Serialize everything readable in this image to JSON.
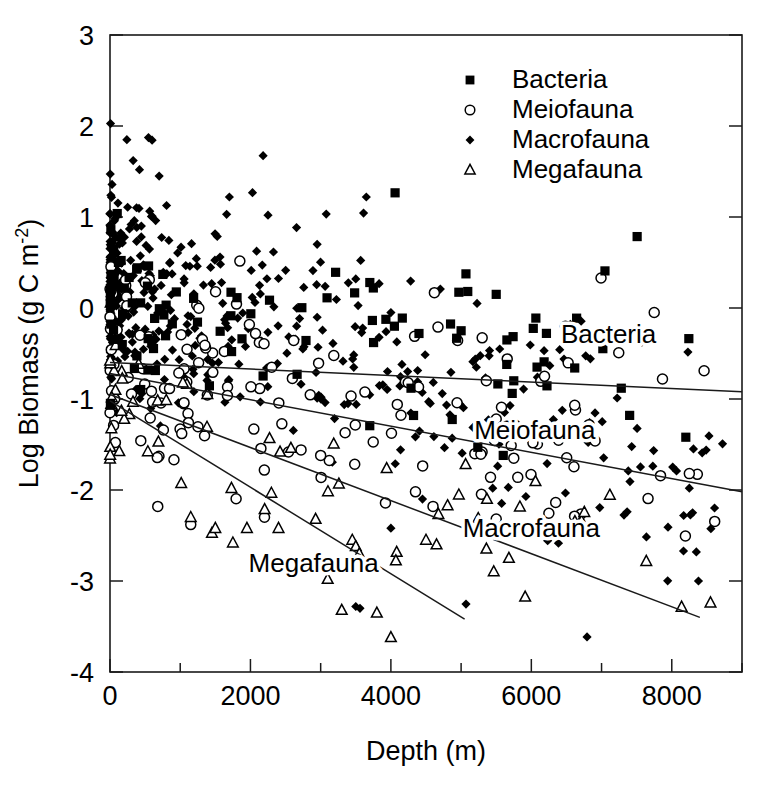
{
  "chart_data": {
    "type": "scatter",
    "title": "",
    "xlabel": "Depth (m)",
    "ylabel": "Log Biomass (g C m-2)",
    "ylabel_base": "Log Biomass (g C m",
    "ylabel_sup": "-2",
    "ylabel_close": ")",
    "xlim": [
      0,
      9000
    ],
    "ylim": [
      -4,
      3
    ],
    "xticks": [
      0,
      2000,
      4000,
      6000,
      8000
    ],
    "xtick_labels": [
      "0",
      "2000",
      "4000",
      "6000",
      "8000"
    ],
    "xminor_step": 1000,
    "yticks": [
      -4,
      -3,
      -2,
      -1,
      0,
      1,
      2,
      3
    ],
    "ytick_labels": [
      "-4",
      "-3",
      "-2",
      "-1",
      "0",
      "1",
      "2",
      "3"
    ],
    "grid": false,
    "legend_position": "top-right",
    "series": [
      {
        "name": "Bacteria",
        "marker": "filled-square",
        "color": "#000000",
        "n_points": 96,
        "inplot_label": "Bacteria",
        "fit": {
          "x0": 0,
          "y0": -0.6,
          "x1": 9000,
          "y1": -0.92
        },
        "label_xy": [
          7100,
          -0.38
        ],
        "cloud": {
          "y_at_x0": -0.2,
          "slope_per_m": -4e-05,
          "spread": 0.52,
          "depth_bias": 0.55
        },
        "outliers": [
          [
            3700,
            0.28
          ],
          [
            3750,
            0.22
          ],
          [
            4050,
            -0.2
          ],
          [
            4400,
            -0.28
          ],
          [
            5000,
            -0.25
          ],
          [
            5500,
            0.15
          ],
          [
            5650,
            -0.62
          ],
          [
            5750,
            -0.8
          ],
          [
            7400,
            -1.18
          ],
          [
            8200,
            -1.42
          ],
          [
            5600,
            -1.62
          ]
        ]
      },
      {
        "name": "Meiofauna",
        "marker": "open-circle",
        "color": "#000000",
        "n_points": 150,
        "inplot_label": "Meiofauna",
        "fit": {
          "x0": 0,
          "y0": -0.72,
          "x1": 9000,
          "y1": -2.02
        },
        "label_xy": [
          6050,
          -1.44
        ],
        "cloud": {
          "y_at_x0": -0.55,
          "slope_per_m": -0.00014,
          "spread": 0.55,
          "depth_bias": 0.5
        },
        "outliers": [
          [
            5500,
            -1.22
          ],
          [
            5650,
            -1.3
          ],
          [
            4350,
            -2.02
          ],
          [
            4600,
            -2.18
          ],
          [
            5500,
            -2.32
          ],
          [
            7750,
            -0.05
          ],
          [
            8250,
            -1.82
          ],
          [
            5750,
            -1.65
          ],
          [
            2200,
            -2.3
          ],
          [
            1150,
            -2.38
          ],
          [
            3000,
            -1.62
          ]
        ]
      },
      {
        "name": "Macrofauna",
        "marker": "filled-diamond",
        "color": "#000000",
        "n_points": 460,
        "inplot_label": "Macrofauna",
        "fit": {
          "x0": 0,
          "y0": -0.95,
          "x1": 8400,
          "y1": -3.4
        },
        "label_xy": [
          6000,
          -2.52
        ],
        "cloud": {
          "y_at_x0": 0.3,
          "slope_per_m": -0.00026,
          "spread": 0.62,
          "depth_bias": 0.85
        },
        "outliers": [
          [
            240,
            1.85
          ],
          [
            330,
            1.62
          ],
          [
            420,
            1.52
          ],
          [
            700,
            1.45
          ],
          [
            1700,
            1.22
          ],
          [
            2250,
            1.02
          ],
          [
            3650,
            1.22
          ],
          [
            2950,
            0.7
          ],
          [
            3500,
            0.32
          ],
          [
            4000,
            -0.05
          ],
          [
            8250,
            -1.98
          ],
          [
            8350,
            -2.68
          ],
          [
            8380,
            -3.0
          ],
          [
            2850,
            -2.88
          ],
          [
            3500,
            -3.28
          ],
          [
            3560,
            -3.3
          ],
          [
            5450,
            -1.98
          ],
          [
            4450,
            -2.1
          ],
          [
            4000,
            -2.42
          ]
        ]
      },
      {
        "name": "Megafauna",
        "marker": "open-triangle",
        "color": "#000000",
        "n_points": 62,
        "inplot_label": "Megafauna",
        "fit": {
          "x0": 0,
          "y0": -1.02,
          "x1": 5050,
          "y1": -3.42
        },
        "label_xy": [
          2900,
          -2.9
        ],
        "cloud": {
          "y_at_x0": -1.15,
          "slope_per_m": -0.00022,
          "spread": 0.42,
          "depth_bias": 0.6
        },
        "outliers": [
          [
            1150,
            -2.3
          ],
          [
            1500,
            -2.42
          ],
          [
            1950,
            -2.42
          ],
          [
            2400,
            -2.42
          ],
          [
            1750,
            -2.58
          ],
          [
            3450,
            -2.55
          ],
          [
            3500,
            -2.62
          ],
          [
            3550,
            -2.7
          ],
          [
            4500,
            -2.55
          ],
          [
            4650,
            -2.6
          ],
          [
            3300,
            -3.32
          ],
          [
            3800,
            -3.35
          ],
          [
            4000,
            -3.62
          ],
          [
            3100,
            -2.98
          ]
        ]
      }
    ]
  },
  "legend": {
    "items": [
      {
        "label": "Bacteria",
        "marker": "filled-square"
      },
      {
        "label": "Meiofauna",
        "marker": "open-circle"
      },
      {
        "label": "Macrofauna",
        "marker": "filled-diamond"
      },
      {
        "label": "Megafauna",
        "marker": "open-triangle"
      }
    ]
  },
  "colors": {
    "ink": "#000000",
    "axis": "#1a1a1a",
    "background": "#ffffff"
  }
}
